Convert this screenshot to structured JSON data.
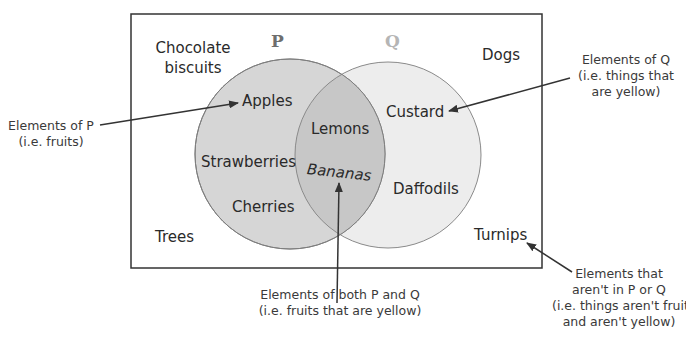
{
  "diagram": {
    "type": "venn",
    "universal_set": {
      "elements": [
        "Chocolate biscuits",
        "Dogs",
        "Trees",
        "Turnips"
      ]
    },
    "sets": [
      {
        "name": "P",
        "color": "#d5d5d5",
        "label_color": "#6e6e6e",
        "elements_only": [
          "Apples",
          "Strawberries",
          "Cherries"
        ]
      },
      {
        "name": "Q",
        "color": "#ececec",
        "label_color": "#b7b7b7",
        "elements_only": [
          "Custard",
          "Daffodils"
        ]
      }
    ],
    "intersection": {
      "color": "#c4c4c4",
      "elements": [
        "Lemons",
        "Bananas"
      ]
    }
  },
  "labels": {
    "set_p": "P",
    "set_q": "Q",
    "chocolate_1": "Chocolate",
    "chocolate_2": "biscuits",
    "dogs": "Dogs",
    "trees": "Trees",
    "turnips": "Turnips",
    "apples": "Apples",
    "strawberries": "Strawberries",
    "cherries": "Cherries",
    "lemons": "Lemons",
    "bananas": "Bananas",
    "custard": "Custard",
    "daffodils": "Daffodils"
  },
  "annotations": {
    "p": {
      "line1": "Elements of P",
      "line2": "(i.e. fruits)"
    },
    "q": {
      "line1": "Elements of Q",
      "line2": "(i.e. things that",
      "line3": "are yellow)"
    },
    "both": {
      "line1": "Elements of both P and Q",
      "line2": "(i.e. fruits that are yellow)"
    },
    "neither": {
      "line1": "Elements that",
      "line2": "aren't in P or Q",
      "line3": "(i.e. things aren't fruits",
      "line4": "and aren't yellow)"
    }
  }
}
